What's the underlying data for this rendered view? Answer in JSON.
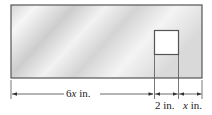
{
  "diagram": {
    "colors": {
      "outline": "#555555",
      "fill_light": "#f4f4f4",
      "fill_dark": "#cfcfcf",
      "hole": "#ffffff",
      "dimension_line": "#444444"
    },
    "labels": {
      "left_dim": {
        "coef": "6",
        "var": "x",
        "unit": " in."
      },
      "hole_dim": {
        "text": "2 in."
      },
      "right_dim": {
        "var": "x",
        "unit": " in."
      }
    }
  }
}
